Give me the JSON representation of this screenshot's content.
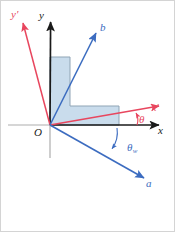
{
  "figure": {
    "background_color": "#ffffff",
    "width": 175,
    "height": 232,
    "colors": {
      "axis_black": "#1a1a1a",
      "axis_stub_gray": "#a8a8a8",
      "rotated_axis_red": "#e8465e",
      "vector_blue": "#3c6cc0",
      "shape_fill": "#c9dcec",
      "shape_stroke": "#8fa4b5",
      "frame_gray": "#cfcfcf"
    },
    "origin": {
      "label": "O",
      "x": 50,
      "y": 125,
      "color": "#1a1a1a"
    },
    "axes": [
      {
        "name": "y-axis",
        "label": "y",
        "color": "#1a1a1a",
        "tip_x": 51,
        "tip_y": 18
      },
      {
        "name": "x-axis",
        "label": "x",
        "color": "#1a1a1a",
        "tip_x": 163,
        "tip_y": 125
      }
    ],
    "rotated_axes": [
      {
        "name": "y-prime-axis",
        "label": "y",
        "prime": "′",
        "color": "#e8465e",
        "tip_x": 21,
        "tip_y": 19
      },
      {
        "name": "x-prime-axis",
        "label": "x",
        "prime": "′",
        "color": "#e8465e",
        "tip_x": 163,
        "tip_y": 105
      }
    ],
    "vectors": [
      {
        "name": "vector-b",
        "label": "b",
        "color": "#3c6cc0",
        "tip_x": 99,
        "tip_y": 29
      },
      {
        "name": "vector-a",
        "label": "a",
        "color": "#3c6cc0",
        "tip_x": 147,
        "tip_y": 180
      }
    ],
    "angles": [
      {
        "name": "theta",
        "label": "θ",
        "subscript": "",
        "color": "#e8465e",
        "between": "x-axis and x-prime-axis"
      },
      {
        "name": "theta-w",
        "label": "θ",
        "subscript": "w",
        "color": "#3c6cc0",
        "between": "x-axis and vector-a"
      }
    ],
    "shape": {
      "name": "l-shaped-region",
      "fill": "#c9dcec",
      "stroke": "#8fa4b5",
      "points": "50,57 70,57 70,106 119,106 119,125 50,125"
    }
  }
}
